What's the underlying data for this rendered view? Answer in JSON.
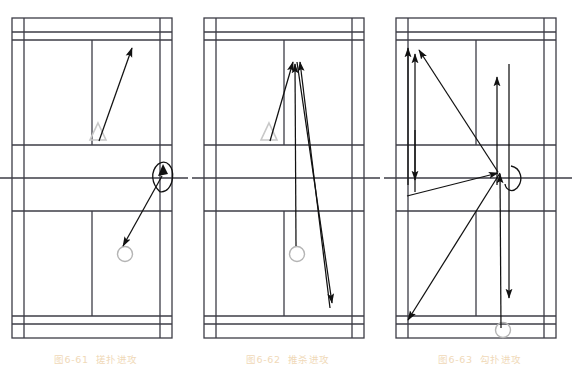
{
  "figure": {
    "panel_count": 3,
    "background_color": "#ffffff",
    "line_color": "#3c3c46",
    "marker_triangle_color": "#c8c8c8",
    "marker_circle_color": "#b4b4b4",
    "arrow_color": "#111111",
    "caption_color": "#f0d9b8"
  },
  "panels": [
    {
      "id": "panel-1",
      "caption_number": "图6-61",
      "caption_text": "搓扑进攻",
      "markers": [
        {
          "name": "triangle-marker",
          "type": "triangle",
          "x": 98,
          "y": 133
        },
        {
          "name": "circle-marker",
          "type": "circle",
          "x": 125,
          "y": 254
        },
        {
          "name": "racket-marker",
          "type": "racket",
          "x": 163,
          "y": 176
        }
      ],
      "shot_arrows": [
        {
          "name": "shot-arrow-1",
          "from_x": 99,
          "from_y": 141,
          "to_x": 132,
          "to_y": 46,
          "direction": "up"
        },
        {
          "name": "shot-arrow-2",
          "from_x": 162,
          "from_y": 176,
          "to_x": 123,
          "to_y": 247,
          "direction": "down"
        }
      ]
    },
    {
      "id": "panel-2",
      "caption_number": "图6-62",
      "caption_text": "推杀进攻",
      "markers": [
        {
          "name": "triangle-marker",
          "type": "triangle",
          "x": 77,
          "y": 133
        },
        {
          "name": "circle-marker",
          "type": "circle",
          "x": 105,
          "y": 254
        }
      ],
      "shot_arrows": [
        {
          "name": "shot-arrow-1",
          "from_x": 78,
          "from_y": 141,
          "to_x": 101,
          "to_y": 60,
          "direction": "up"
        },
        {
          "name": "shot-arrow-2",
          "from_x": 104,
          "from_y": 247,
          "to_x": 103,
          "to_y": 62,
          "direction": "up"
        },
        {
          "name": "shot-arrow-3",
          "from_x": 138,
          "from_y": 310,
          "to_x": 107,
          "to_y": 60,
          "direction": "up"
        },
        {
          "name": "shot-arrow-4",
          "from_x": 104,
          "from_y": 60,
          "to_x": 140,
          "to_y": 305,
          "direction": "down"
        }
      ]
    },
    {
      "id": "panel-3",
      "caption_number": "图6-63",
      "caption_text": "勾扑进攻",
      "markers": [
        {
          "name": "circle-marker",
          "type": "circle",
          "x": 119,
          "y": 330
        },
        {
          "name": "racket-marker",
          "type": "racket",
          "x": 127,
          "y": 176
        }
      ],
      "shot_arrows": [
        {
          "name": "shot-arrow-1",
          "from_x": 24,
          "from_y": 185,
          "to_x": 24,
          "to_y": 46,
          "direction": "up"
        },
        {
          "name": "shot-arrow-2",
          "from_x": 31,
          "from_y": 190,
          "to_x": 31,
          "to_y": 52,
          "direction": "up"
        },
        {
          "name": "shot-arrow-3",
          "from_x": 31,
          "from_y": 130,
          "to_x": 31,
          "to_y": 182,
          "direction": "down"
        },
        {
          "name": "shot-arrow-4",
          "from_x": 113,
          "from_y": 185,
          "to_x": 113,
          "to_y": 75,
          "direction": "up"
        },
        {
          "name": "shot-arrow-5",
          "from_x": 125,
          "from_y": 62,
          "to_x": 125,
          "to_y": 300,
          "direction": "down"
        },
        {
          "name": "shot-arrow-6",
          "from_x": 114,
          "from_y": 172,
          "to_x": 34,
          "to_y": 48,
          "direction": "up"
        },
        {
          "name": "shot-arrow-7",
          "from_x": 23,
          "from_y": 195,
          "to_x": 116,
          "to_y": 172,
          "direction": "right"
        },
        {
          "name": "shot-arrow-8",
          "from_x": 116,
          "from_y": 172,
          "to_x": 22,
          "to_y": 322,
          "direction": "down-left"
        },
        {
          "name": "shot-arrow-9",
          "from_x": 117,
          "from_y": 330,
          "to_x": 117,
          "to_y": 172,
          "direction": "up"
        }
      ]
    }
  ],
  "court_geometry": {
    "description": "badminton court plan view, doubles lines",
    "outer_left": 12,
    "outer_right": 172,
    "outer_top": 18,
    "outer_bottom": 338,
    "inner_left": 24,
    "inner_right": 160,
    "doubles_service_back_top": 32,
    "doubles_service_back_bottom": 324,
    "back_boundary_top": 40,
    "back_boundary_bottom": 316,
    "short_service_top": 145,
    "short_service_bottom": 211,
    "net_y": 178,
    "net_extend_left": -8,
    "net_extend_right": 188,
    "centre_line_x": 92
  }
}
